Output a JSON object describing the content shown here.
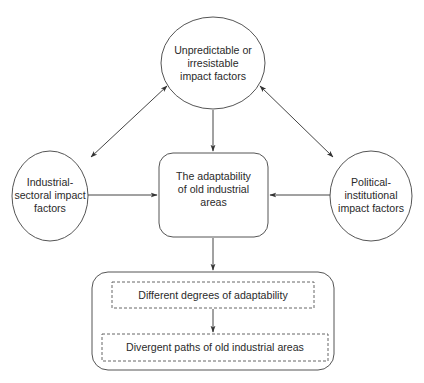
{
  "diagram": {
    "type": "flow-diagram",
    "nodes": {
      "top": {
        "shape": "ellipse",
        "lines": [
          "Unpredictable or",
          "irresistable",
          "impact factors"
        ]
      },
      "left": {
        "shape": "ellipse",
        "lines": [
          "Industrial-",
          "sectoral impact",
          "factors"
        ]
      },
      "right": {
        "shape": "ellipse",
        "lines": [
          "Political-",
          "institutional",
          "impact factors"
        ]
      },
      "center": {
        "shape": "rounded-rectangle",
        "lines": [
          "The adaptability",
          "of old industrial",
          "areas"
        ]
      },
      "outcome_group": {
        "shape": "rounded-rectangle",
        "children": {
          "degrees": {
            "shape": "dashed-rectangle",
            "label": "Different degrees of adaptability"
          },
          "paths": {
            "shape": "dashed-rectangle",
            "label": "Divergent paths of old industrial areas"
          }
        }
      }
    },
    "edges": [
      {
        "from": "top",
        "to": "center",
        "direction": "one-way"
      },
      {
        "from": "left",
        "to": "center",
        "direction": "one-way"
      },
      {
        "from": "right",
        "to": "center",
        "direction": "one-way"
      },
      {
        "from": "top",
        "to": "left",
        "direction": "two-way"
      },
      {
        "from": "top",
        "to": "right",
        "direction": "two-way"
      },
      {
        "from": "center",
        "to": "outcome_group",
        "direction": "one-way"
      },
      {
        "from": "degrees",
        "to": "paths",
        "direction": "one-way"
      }
    ],
    "colors": {
      "stroke": "#555555",
      "text": "#2a2a2a",
      "background": "#ffffff"
    }
  }
}
